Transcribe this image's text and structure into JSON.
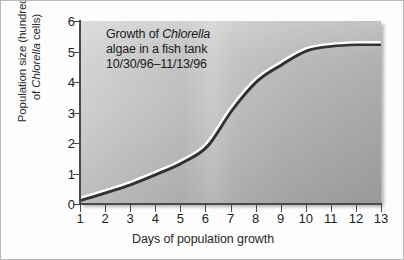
{
  "chart_data": {
    "type": "line",
    "title": "Growth of Chlorella algae in a fish tank",
    "title_lines": [
      {
        "pre": "Growth of ",
        "italic": "Chlorella",
        "post": ""
      },
      {
        "pre": "algae in a fish tank",
        "italic": "",
        "post": ""
      },
      {
        "pre": "10/30/96–11/13/96",
        "italic": "",
        "post": ""
      }
    ],
    "subtitle": "10/30/96–11/13/96",
    "xlabel": "Days of population growth",
    "ylabel": "Population size (hundreds of Chlorella cells)",
    "ylabel_lines": [
      {
        "pre": "Population size (hundreds",
        "italic": "",
        "post": ""
      },
      {
        "pre": "of ",
        "italic": "Chlorella",
        "post": " cells)"
      }
    ],
    "x": [
      1,
      2,
      3,
      4,
      5,
      6,
      7,
      8,
      9,
      10,
      11,
      12,
      13
    ],
    "values": [
      0.2,
      0.45,
      0.72,
      1.05,
      1.42,
      1.95,
      3.15,
      4.1,
      4.65,
      5.1,
      5.25,
      5.3,
      5.3
    ],
    "series": [
      {
        "name": "Chlorella population",
        "values": [
          0.2,
          0.45,
          0.72,
          1.05,
          1.42,
          1.95,
          3.15,
          4.1,
          4.65,
          5.1,
          5.25,
          5.3,
          5.3
        ]
      }
    ],
    "xlim": [
      1,
      13
    ],
    "ylim": [
      0,
      6
    ],
    "xticks": [
      "1",
      "2",
      "3",
      "4",
      "5",
      "6",
      "7",
      "8",
      "9",
      "10",
      "11",
      "12",
      "13"
    ],
    "yticks": [
      "0",
      "1",
      "2",
      "3",
      "4",
      "5",
      "6"
    ],
    "grid": false,
    "legend": "none",
    "line_color": "#ffffff",
    "line_shadow_color": "#1a1a1a",
    "plot_background": "#bdbdbd",
    "axis_color": "#4a4a4a",
    "text_color": "#1d1d1d"
  }
}
